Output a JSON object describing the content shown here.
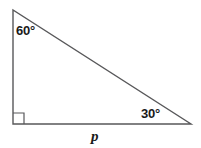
{
  "figure": {
    "type": "right-triangle",
    "background_color": "#ffffff",
    "stroke_color": "#58585a",
    "text_color": "#1a1a1a",
    "vertices": {
      "apex": {
        "x": 13,
        "y": 10
      },
      "right_angle": {
        "x": 13,
        "y": 124
      },
      "base_right": {
        "x": 191,
        "y": 124
      }
    },
    "right_angle_marker": {
      "present": true,
      "at_vertex": "right_angle",
      "size": 11
    }
  },
  "labels": {
    "angle_apex": "60°",
    "angle_base_right": "30°",
    "side_base": "p"
  },
  "measures": {
    "angle_apex_degrees": 60,
    "angle_base_right_degrees": 30,
    "angle_bottom_left_degrees": 90,
    "unknown_side": "p"
  }
}
